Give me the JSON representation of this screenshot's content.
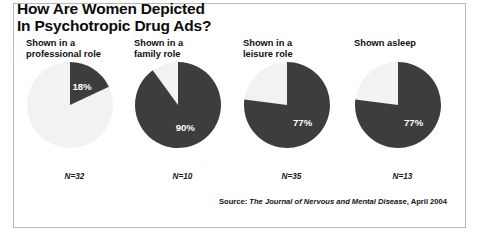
{
  "figure": {
    "title": "How Are Women Depicted\nIn Psychotropic Drug Ads?",
    "source_prefix": "Source: ",
    "source_journal": "The Journal of Nervous and Mental Disease",
    "source_suffix": ", April 2004"
  },
  "colors": {
    "slice_dark": "#3d3d3d",
    "slice_light": "#f2f2f2",
    "value_text": "#ffffff",
    "frame": "#b9b9b9",
    "text": "#000000"
  },
  "chart_data": {
    "type": "pie",
    "title": "How Are Women Depicted In Psychotropic Drug Ads?",
    "source": "Source: The Journal of Nervous and Mental Disease, April 2004",
    "legend": "none",
    "grid": false,
    "unit": "percent",
    "charts": [
      {
        "label": "Shown in a\nprofessional role",
        "value": 18,
        "value_label": "18%",
        "remainder": 82,
        "n_label": "N=32",
        "n": 32
      },
      {
        "label": "Shown in a\nfamily role",
        "value": 90,
        "value_label": "90%",
        "remainder": 10,
        "n_label": "N=10",
        "n": 10
      },
      {
        "label": "Shown in a\nleisure role",
        "value": 77,
        "value_label": "77%",
        "remainder": 23,
        "n_label": "N=35",
        "n": 35
      },
      {
        "label": "Shown asleep",
        "value": 77,
        "value_label": "77%",
        "remainder": 23,
        "n_label": "N=13",
        "n": 13
      }
    ]
  }
}
